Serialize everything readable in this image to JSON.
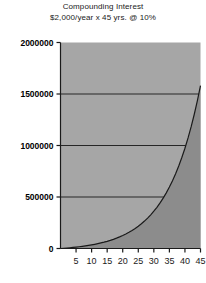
{
  "chart_data": {
    "type": "area",
    "title": "Compounding Interest",
    "subtitle": "$2,000/year x 45 yrs. @ 10%",
    "xlabel": "",
    "ylabel": "",
    "xlim": [
      0,
      45
    ],
    "ylim": [
      0,
      2000000
    ],
    "grid": true,
    "legend": "none",
    "x_ticks": [
      5,
      10,
      15,
      20,
      25,
      30,
      35,
      40,
      45
    ],
    "y_ticks": [
      0,
      500000,
      1000000,
      1500000,
      2000000
    ],
    "y_tick_labels": [
      "0",
      "500000",
      "1000000",
      "1500000",
      "2000000"
    ],
    "x_tick_labels": [
      "5",
      "10",
      "15",
      "20",
      "25",
      "30",
      "35",
      "40",
      "45"
    ],
    "series": [
      {
        "name": "Accumulated value",
        "x": [
          0,
          1,
          2,
          3,
          4,
          5,
          6,
          7,
          8,
          9,
          10,
          11,
          12,
          13,
          14,
          15,
          16,
          17,
          18,
          19,
          20,
          21,
          22,
          23,
          24,
          25,
          26,
          27,
          28,
          29,
          30,
          31,
          32,
          33,
          34,
          35,
          36,
          37,
          38,
          39,
          40,
          41,
          42,
          43,
          44,
          45
        ],
        "values": [
          0,
          2200,
          4620,
          7282,
          10210,
          13431,
          16974,
          20872,
          25159,
          29875,
          35062,
          40769,
          47045,
          53950,
          61545,
          69899,
          79089,
          89198,
          100318,
          112550,
          126005,
          140805,
          157086,
          174995,
          194694,
          216364,
          240200,
          266420,
          295262,
          326988,
          361887,
          400276,
          442503,
          488954,
          540049,
          596254,
          658079,
          726087,
          800896,
          883185,
          973704,
          1073274,
          1182801,
          1303282,
          1435810,
          1581591
        ]
      }
    ],
    "colors": {
      "plot_background": "#a6a6a6",
      "area_fill": "#8c8c8c",
      "curve": "#1a1a1a",
      "gridline": "#262626",
      "axis": "#1a1a1a",
      "page_background": "#ffffff"
    }
  }
}
